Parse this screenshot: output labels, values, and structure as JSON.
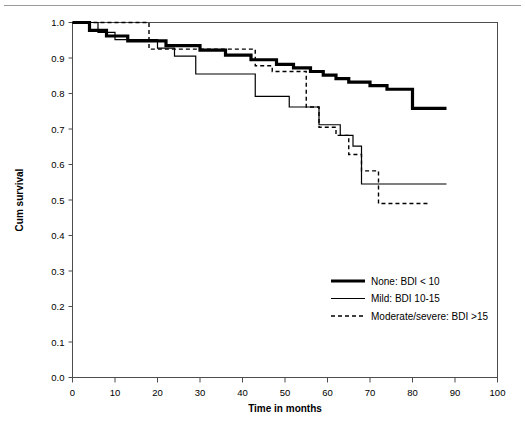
{
  "chart_data": {
    "type": "line",
    "title": "",
    "xlabel": "Time in months",
    "ylabel": "Cum survival",
    "xlim": [
      0,
      100
    ],
    "ylim": [
      0.0,
      1.0
    ],
    "xticks": [
      "0",
      "10",
      "20",
      "30",
      "40",
      "50",
      "60",
      "70",
      "80",
      "90",
      "100"
    ],
    "yticks": [
      "0.0",
      "0.1",
      "0.2",
      "0.3",
      "0.4",
      "0.5",
      "0.6",
      "0.7",
      "0.8",
      "0.9",
      "1.0"
    ],
    "grid": false,
    "legend_position": "center-right",
    "series": [
      {
        "name": "None: BDI < 10",
        "style": "solid-thick",
        "points": [
          [
            0,
            1.0
          ],
          [
            4,
            1.0
          ],
          [
            4,
            0.978
          ],
          [
            8,
            0.978
          ],
          [
            8,
            0.962
          ],
          [
            13,
            0.962
          ],
          [
            13,
            0.948
          ],
          [
            22,
            0.948
          ],
          [
            22,
            0.935
          ],
          [
            30,
            0.935
          ],
          [
            30,
            0.922
          ],
          [
            36,
            0.922
          ],
          [
            36,
            0.908
          ],
          [
            42,
            0.908
          ],
          [
            42,
            0.895
          ],
          [
            48,
            0.895
          ],
          [
            48,
            0.882
          ],
          [
            52,
            0.882
          ],
          [
            52,
            0.872
          ],
          [
            56,
            0.872
          ],
          [
            56,
            0.862
          ],
          [
            59,
            0.862
          ],
          [
            59,
            0.852
          ],
          [
            62,
            0.852
          ],
          [
            62,
            0.842
          ],
          [
            65,
            0.842
          ],
          [
            65,
            0.832
          ],
          [
            70,
            0.832
          ],
          [
            70,
            0.822
          ],
          [
            74,
            0.822
          ],
          [
            74,
            0.812
          ],
          [
            80,
            0.812
          ],
          [
            80,
            0.758
          ],
          [
            88,
            0.758
          ]
        ]
      },
      {
        "name": "Mild: BDI 10-15",
        "style": "solid-thin",
        "points": [
          [
            0,
            1.0
          ],
          [
            6,
            1.0
          ],
          [
            6,
            0.972
          ],
          [
            10,
            0.972
          ],
          [
            10,
            0.952
          ],
          [
            20,
            0.952
          ],
          [
            20,
            0.928
          ],
          [
            24,
            0.928
          ],
          [
            24,
            0.905
          ],
          [
            29,
            0.905
          ],
          [
            29,
            0.855
          ],
          [
            43,
            0.855
          ],
          [
            43,
            0.792
          ],
          [
            51,
            0.792
          ],
          [
            51,
            0.762
          ],
          [
            58,
            0.762
          ],
          [
            58,
            0.712
          ],
          [
            63,
            0.712
          ],
          [
            63,
            0.682
          ],
          [
            66,
            0.682
          ],
          [
            66,
            0.652
          ],
          [
            68,
            0.652
          ],
          [
            68,
            0.545
          ],
          [
            88,
            0.545
          ]
        ]
      },
      {
        "name": "Moderate/severe: BDI >15",
        "style": "dashed",
        "points": [
          [
            0,
            1.0
          ],
          [
            18,
            1.0
          ],
          [
            18,
            0.925
          ],
          [
            43,
            0.925
          ],
          [
            43,
            0.878
          ],
          [
            47,
            0.878
          ],
          [
            47,
            0.862
          ],
          [
            55,
            0.862
          ],
          [
            55,
            0.762
          ],
          [
            58,
            0.762
          ],
          [
            58,
            0.705
          ],
          [
            62,
            0.705
          ],
          [
            62,
            0.682
          ],
          [
            65,
            0.682
          ],
          [
            65,
            0.628
          ],
          [
            68,
            0.628
          ],
          [
            68,
            0.582
          ],
          [
            72,
            0.582
          ],
          [
            72,
            0.49
          ],
          [
            84,
            0.49
          ]
        ]
      }
    ],
    "legend": [
      {
        "label": "None: BDI < 10",
        "style": "solid-thick"
      },
      {
        "label": "Mild: BDI 10-15",
        "style": "solid-thin"
      },
      {
        "label": "Moderate/severe: BDI >15",
        "style": "dashed"
      }
    ],
    "colors": {
      "line": "#000000",
      "frame": "#4d4d4d",
      "rule": "#9a9a9a"
    }
  }
}
